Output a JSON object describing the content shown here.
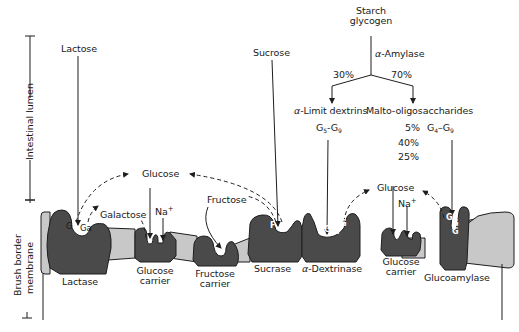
{
  "diagram": {
    "type": "biological-process",
    "side_labels": {
      "lumen": "Intestinal lumen",
      "membrane_line1": "Brush border",
      "membrane_line2": "membrane"
    },
    "starch_pathway": {
      "source_line1": "Starch",
      "source_line2": "glycogen",
      "enzyme_prefix": "α",
      "enzyme_name": "-Amylase",
      "left_pct": "30%",
      "right_pct": "70%",
      "left_product_prefix": "α",
      "left_product_name": "-Limit dextrins",
      "left_product_range": {
        "a": "G",
        "a_sub": "5",
        "sep": "-",
        "b": "G",
        "b_sub": "9"
      },
      "right_product": "Malto-oligosaccharides",
      "right_product_range": {
        "a": "G",
        "a_sub": "4",
        "sep": "–",
        "b": "G",
        "b_sub": "9"
      },
      "right_pcts": [
        "5%",
        "40%",
        "25%"
      ]
    },
    "substrates": {
      "lactose": "Lactose",
      "sucrose": "Sucrose",
      "fructose": "Fructose"
    },
    "products": {
      "glucose_left": "Glucose",
      "glucose_right": "Glucose",
      "galactose": "Galactose",
      "sodium_left": "Na",
      "sodium_right": "Na",
      "sodium_charge": "+"
    },
    "bound_residues": {
      "lactase_g": "G",
      "lactase_ga": "Ga",
      "sucrase_f": "F",
      "sucrase_g": "G",
      "glucose_letter": "G"
    },
    "membrane_proteins": [
      {
        "id": "lactase",
        "label_line1": "Lactase",
        "label_line2": ""
      },
      {
        "id": "glucose-carrier-1",
        "label_line1": "Glucose",
        "label_line2": "carrier"
      },
      {
        "id": "fructose-carrier",
        "label_line1": "Fructose",
        "label_line2": "carrier"
      },
      {
        "id": "sucrase",
        "label_line1": "Sucrase",
        "label_line2": ""
      },
      {
        "id": "dextrinase",
        "label_prefix": "α",
        "label_line1": "-Dextrinase",
        "label_line2": ""
      },
      {
        "id": "glucose-carrier-2",
        "label_line1": "Glucose",
        "label_line2": "carrier"
      },
      {
        "id": "glucoamylase",
        "label_line1": "Glucoamylase",
        "label_line2": ""
      }
    ],
    "colors": {
      "protein_fill": "#4a4a4a",
      "membrane_fill": "#c8c8c8",
      "outline": "#1e1e1e",
      "text": "#1a1a1a",
      "background": "#ffffff"
    }
  }
}
